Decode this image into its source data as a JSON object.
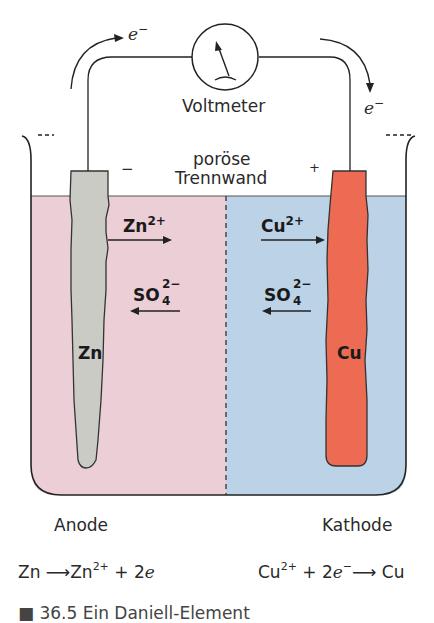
{
  "diagram": {
    "colors": {
      "anode_solution": "#ecced6",
      "cathode_solution": "#bcd2e6",
      "zinc_electrode": "#cbcbc6",
      "copper_electrode": "#ec6b52",
      "line": "#222222"
    },
    "labels": {
      "electron_left": "e",
      "electron_left_sup": "−",
      "electron_right": "e",
      "electron_right_sup": "−",
      "voltmeter": "Voltmeter",
      "membrane_line1": "poröse",
      "membrane_line2": "Trennwand",
      "minus_sign": "−",
      "plus_sign": "+",
      "zn_ion": "Zn",
      "zn_ion_charge": "2+",
      "cu_ion": "Cu",
      "cu_ion_charge": "2+",
      "sulfate_left": "SO",
      "sulfate_left_sub": "4",
      "sulfate_left_charge": "2−",
      "sulfate_right": "SO",
      "sulfate_right_sub": "4",
      "sulfate_right_charge": "2−",
      "zinc_electrode": "Zn",
      "copper_electrode": "Cu",
      "anode": "Anode",
      "cathode": "Kathode"
    },
    "equations": {
      "anode": {
        "reactant": "Zn",
        "arrow": "⟶",
        "product": "Zn",
        "product_charge": "2+",
        "plus": "+ 2",
        "electron": "e",
        "electron_charge": ""
      },
      "cathode": {
        "reactant": "Cu",
        "reactant_charge": "2+",
        "plus": "+ 2",
        "electron": "e",
        "electron_charge": "−",
        "arrow": "⟶",
        "product": "Cu"
      }
    },
    "caption_partial": "■ 36.5 Ein Daniell-Element"
  }
}
